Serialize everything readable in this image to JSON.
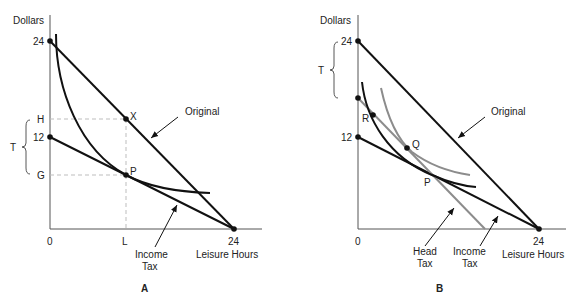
{
  "panels": [
    {
      "id": "A",
      "panel_label": "A",
      "y_axis_label": "Dollars",
      "x_axis_label": "Leisure Hours",
      "origin_label": "0",
      "y_ticks": {
        "top": "24",
        "mid": "12",
        "H": "H",
        "G": "G"
      },
      "x_ticks": {
        "L": "L",
        "end": "24"
      },
      "brace_label": "T",
      "points": {
        "X": "X",
        "P": "P"
      },
      "annotations": {
        "original": "Original",
        "income_tax_line1": "Income",
        "income_tax_line2": "Tax"
      }
    },
    {
      "id": "B",
      "panel_label": "B",
      "y_axis_label": "Dollars",
      "x_axis_label": "Leisure Hours",
      "origin_label": "0",
      "y_ticks": {
        "top": "24",
        "mid": "12"
      },
      "x_ticks": {
        "end": "24"
      },
      "brace_label": "T",
      "points": {
        "R": "R",
        "Q": "Q",
        "P": "P"
      },
      "annotations": {
        "original": "Original",
        "head_tax_line1": "Head",
        "head_tax_line2": "Tax",
        "income_tax_line1": "Income",
        "income_tax_line2": "Tax"
      }
    }
  ],
  "colors": {
    "ink": "#111111",
    "gray_curve": "#8c8c8c",
    "guide": "#bdbdbd"
  }
}
